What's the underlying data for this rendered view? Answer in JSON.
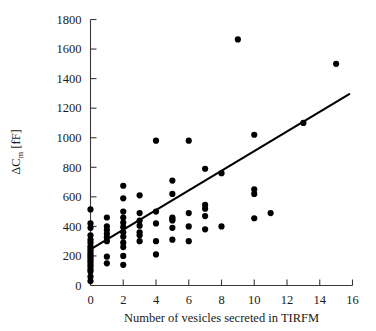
{
  "chart_data": {
    "type": "scatter",
    "title": "",
    "xlabel": "Number of vesicles secreted in TIRFM",
    "ylabel": "ΔC",
    "ylabel_sub": "m",
    "ylabel_unit": " [fF]",
    "ylabel_full": "ΔCm [fF]",
    "xlim": [
      0,
      16
    ],
    "ylim": [
      0,
      1800
    ],
    "xticks": [
      0,
      2,
      4,
      6,
      8,
      10,
      12,
      14,
      16
    ],
    "yticks": [
      0,
      200,
      400,
      600,
      800,
      1000,
      1200,
      1400,
      1600,
      1800
    ],
    "xtick_labels": [
      "0",
      "2",
      "4",
      "6",
      "8",
      "10",
      "12",
      "14",
      "16"
    ],
    "ytick_labels": [
      "0",
      "200",
      "400",
      "600",
      "800",
      "1000",
      "1200",
      "1400",
      "1600",
      "1800"
    ],
    "grid": false,
    "legend": null,
    "marker": "filled-circle",
    "marker_color": "#000000",
    "marker_size_px": 3.1,
    "points": [
      [
        0,
        30
      ],
      [
        0,
        60
      ],
      [
        0,
        95
      ],
      [
        0,
        110
      ],
      [
        0,
        130
      ],
      [
        0,
        145
      ],
      [
        0,
        160
      ],
      [
        0,
        175
      ],
      [
        0,
        190
      ],
      [
        0,
        205
      ],
      [
        0,
        220
      ],
      [
        0,
        235
      ],
      [
        0,
        250
      ],
      [
        0,
        265
      ],
      [
        0,
        290
      ],
      [
        0,
        310
      ],
      [
        0,
        340
      ],
      [
        0,
        390
      ],
      [
        0,
        420
      ],
      [
        0,
        515
      ],
      [
        1,
        150
      ],
      [
        1,
        195
      ],
      [
        1,
        300
      ],
      [
        1,
        325
      ],
      [
        1,
        350
      ],
      [
        1,
        375
      ],
      [
        1,
        400
      ],
      [
        1,
        460
      ],
      [
        2,
        140
      ],
      [
        2,
        200
      ],
      [
        2,
        260
      ],
      [
        2,
        290
      ],
      [
        2,
        330
      ],
      [
        2,
        360
      ],
      [
        2,
        395
      ],
      [
        2,
        425
      ],
      [
        2,
        460
      ],
      [
        2,
        500
      ],
      [
        2,
        590
      ],
      [
        2,
        675
      ],
      [
        3,
        300
      ],
      [
        3,
        340
      ],
      [
        3,
        360
      ],
      [
        3,
        405
      ],
      [
        3,
        440
      ],
      [
        3,
        490
      ],
      [
        3,
        610
      ],
      [
        4,
        210
      ],
      [
        4,
        300
      ],
      [
        4,
        420
      ],
      [
        4,
        500
      ],
      [
        4,
        980
      ],
      [
        5,
        310
      ],
      [
        5,
        390
      ],
      [
        5,
        440
      ],
      [
        5,
        450
      ],
      [
        5,
        460
      ],
      [
        5,
        620
      ],
      [
        5,
        710
      ],
      [
        6,
        300
      ],
      [
        6,
        400
      ],
      [
        6,
        490
      ],
      [
        6,
        980
      ],
      [
        7,
        380
      ],
      [
        7,
        470
      ],
      [
        7,
        520
      ],
      [
        7,
        545
      ],
      [
        7,
        790
      ],
      [
        8,
        400
      ],
      [
        8,
        760
      ],
      [
        9,
        1665
      ],
      [
        10,
        455
      ],
      [
        10,
        620
      ],
      [
        10,
        650
      ],
      [
        10,
        1020
      ],
      [
        11,
        490
      ],
      [
        13,
        1100
      ],
      [
        15,
        1500
      ]
    ],
    "fit_line": {
      "label": "linear-regression",
      "x_start": 0,
      "y_start": 245,
      "x_end": 15.8,
      "y_end": 1295,
      "slope": 66.5,
      "intercept": 245
    }
  }
}
